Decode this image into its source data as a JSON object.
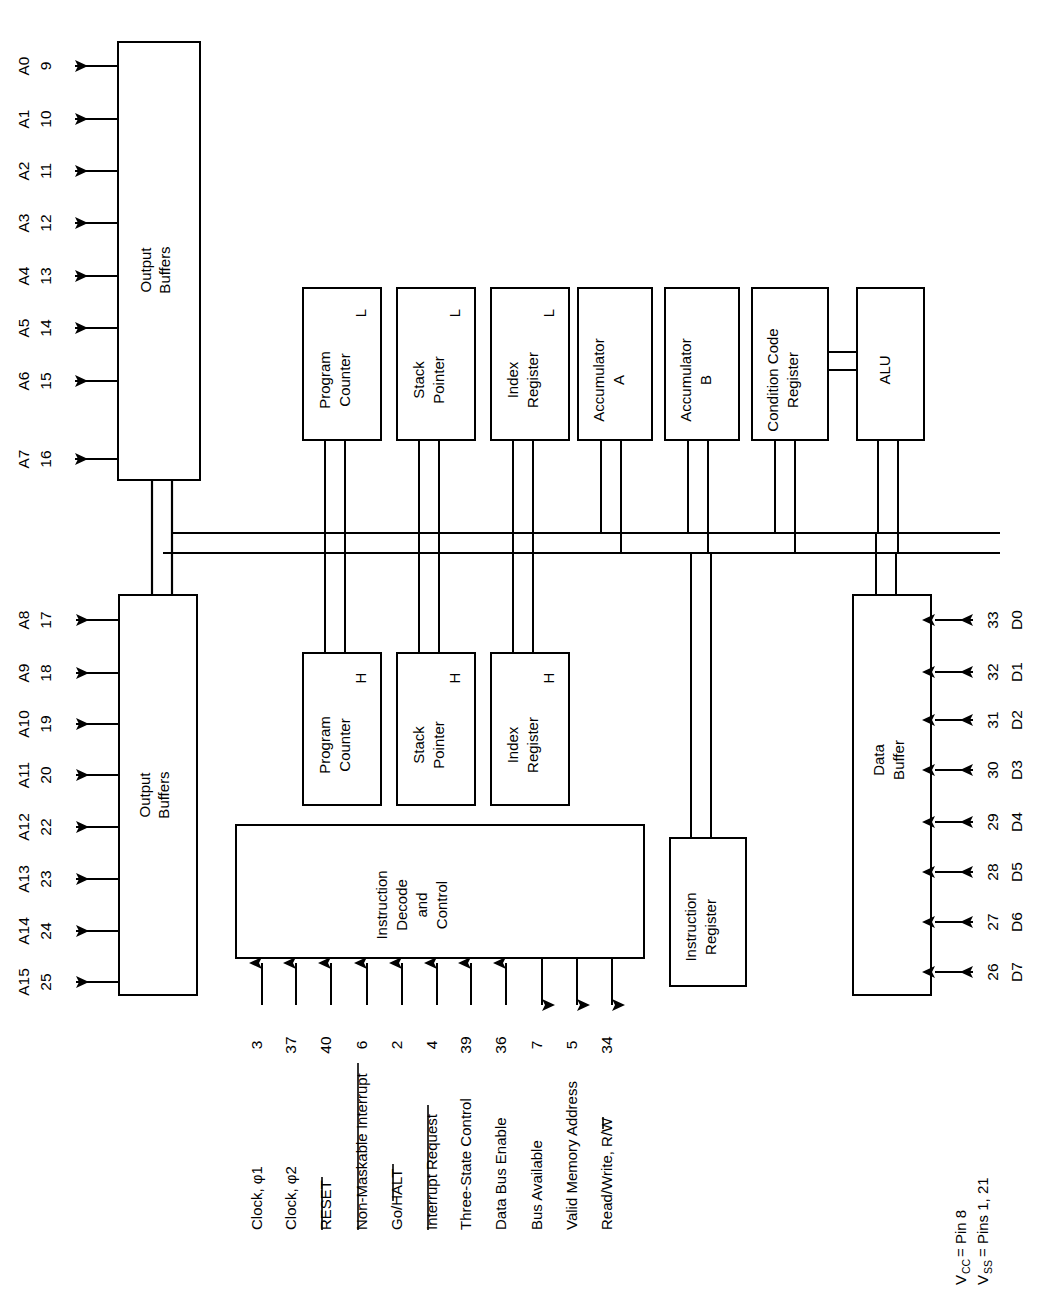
{
  "figure": {
    "type": "block-diagram",
    "orientation": "rotated 90 degrees counter-clockwise",
    "background": "#ffffff",
    "line_color": "#000000"
  },
  "blocks": [
    {
      "id": "output-buffers-low",
      "label_line1": "Output",
      "label_line2": "Buffers"
    },
    {
      "id": "output-buffers-high",
      "label_line1": "Output",
      "label_line2": "Buffers"
    },
    {
      "id": "program-counter-l",
      "label_line1": "Program",
      "label_line2": "Counter",
      "suffix": "L"
    },
    {
      "id": "stack-pointer-l",
      "label_line1": "Stack",
      "label_line2": "Pointer",
      "suffix": "L"
    },
    {
      "id": "index-register-l",
      "label_line1": "Index",
      "label_line2": "Register",
      "suffix": "L"
    },
    {
      "id": "accumulator-a",
      "label_line1": "Accumulator",
      "label_line2": "A"
    },
    {
      "id": "accumulator-b",
      "label_line1": "Accumulator",
      "label_line2": "B"
    },
    {
      "id": "condition-code-register",
      "label_line1": "Condition Code",
      "label_line2": "Register"
    },
    {
      "id": "alu",
      "label_line1": "ALU"
    },
    {
      "id": "program-counter-h",
      "label_line1": "Program",
      "label_line2": "Counter",
      "suffix": "H"
    },
    {
      "id": "stack-pointer-h",
      "label_line1": "Stack",
      "label_line2": "Pointer",
      "suffix": "H"
    },
    {
      "id": "index-register-h",
      "label_line1": "Index",
      "label_line2": "Register",
      "suffix": "H"
    },
    {
      "id": "instruction-decode-and-control",
      "label_line1": "Instruction",
      "label_line2": "Decode",
      "label_line3": "and",
      "label_line4": "Control"
    },
    {
      "id": "instruction-register",
      "label_line1": "Instruction",
      "label_line2": "Register"
    },
    {
      "id": "data-buffer",
      "label_line1": "Data",
      "label_line2": "Buffer"
    }
  ],
  "address_bus_low": {
    "buffer_label_1": "Output",
    "buffer_label_2": "Buffers",
    "signals": [
      {
        "name": "A0",
        "pin": "9"
      },
      {
        "name": "A1",
        "pin": "10"
      },
      {
        "name": "A2",
        "pin": "11"
      },
      {
        "name": "A3",
        "pin": "12"
      },
      {
        "name": "A4",
        "pin": "13"
      },
      {
        "name": "A5",
        "pin": "14"
      },
      {
        "name": "A6",
        "pin": "15"
      },
      {
        "name": "A7",
        "pin": "16"
      }
    ],
    "direction": "out"
  },
  "address_bus_high": {
    "buffer_label_1": "Output",
    "buffer_label_2": "Buffers",
    "signals": [
      {
        "name": "A8",
        "pin": "17"
      },
      {
        "name": "A9",
        "pin": "18"
      },
      {
        "name": "A10",
        "pin": "19"
      },
      {
        "name": "A11",
        "pin": "20"
      },
      {
        "name": "A12",
        "pin": "22"
      },
      {
        "name": "A13",
        "pin": "23"
      },
      {
        "name": "A14",
        "pin": "24"
      },
      {
        "name": "A15",
        "pin": "25"
      }
    ],
    "direction": "out"
  },
  "data_bus": {
    "buffer_label_1": "Data",
    "buffer_label_2": "Buffer",
    "signals": [
      {
        "name": "D0",
        "pin": "33"
      },
      {
        "name": "D1",
        "pin": "32"
      },
      {
        "name": "D2",
        "pin": "31"
      },
      {
        "name": "D3",
        "pin": "30"
      },
      {
        "name": "D4",
        "pin": "29"
      },
      {
        "name": "D5",
        "pin": "28"
      },
      {
        "name": "D6",
        "pin": "27"
      },
      {
        "name": "D7",
        "pin": "26"
      }
    ],
    "direction": "bidirectional"
  },
  "control_signals": [
    {
      "label": "Clock, φ1",
      "pin": "3",
      "direction": "in",
      "overbar": "none"
    },
    {
      "label": "Clock, φ2",
      "pin": "37",
      "direction": "in",
      "overbar": "none"
    },
    {
      "label": "RESET",
      "pin": "40",
      "direction": "in",
      "overbar": "full"
    },
    {
      "label": "Non-Maskable Interrupt",
      "pin": "6",
      "direction": "in",
      "overbar": "full"
    },
    {
      "label": "Go/HALT",
      "pin": "2",
      "direction": "in",
      "overbar": "partial",
      "overbar_part": "HALT"
    },
    {
      "label": "Interrupt Request",
      "pin": "4",
      "direction": "in",
      "overbar": "full"
    },
    {
      "label": "Three-State Control",
      "pin": "39",
      "direction": "in",
      "overbar": "none"
    },
    {
      "label": "Data Bus Enable",
      "pin": "36",
      "direction": "in",
      "overbar": "none"
    },
    {
      "label": "Bus Available",
      "pin": "7",
      "direction": "out",
      "overbar": "none"
    },
    {
      "label": "Valid Memory Address",
      "pin": "5",
      "direction": "out",
      "overbar": "none"
    },
    {
      "label": "Read/Write, R/W",
      "pin": "34",
      "direction": "out",
      "overbar": "partial",
      "overbar_part": "W"
    }
  ],
  "notes": [
    {
      "text": "VCC = Pin 8",
      "main": "V",
      "sub": "CC",
      "rest": " = Pin 8"
    },
    {
      "text": "VSS = Pins 1, 21",
      "main": "V",
      "sub": "SS",
      "rest": " = Pins 1, 21"
    }
  ]
}
